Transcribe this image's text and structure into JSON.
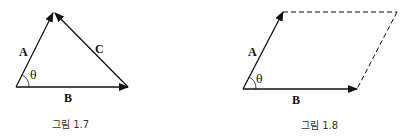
{
  "figures": [
    {
      "caption": "그림 1.7",
      "type": "vector-triangle",
      "vectors": [
        {
          "label": "A"
        },
        {
          "label": "B"
        },
        {
          "label": "C"
        }
      ],
      "angle_label": "θ"
    },
    {
      "caption": "그림 1.8",
      "type": "vector-parallelogram",
      "vectors": [
        {
          "label": "A"
        },
        {
          "label": "B"
        }
      ],
      "angle_label": "θ",
      "dashed_sides": 2
    }
  ],
  "colors": {
    "stroke": "#111111",
    "caption": "#333333"
  }
}
